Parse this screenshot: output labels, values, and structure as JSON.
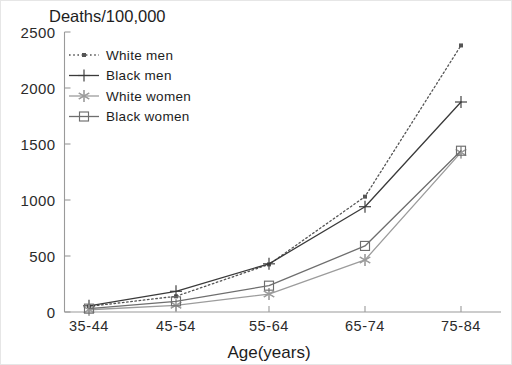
{
  "chart_data": {
    "type": "line",
    "title": "Deaths/100,000",
    "xlabel": "Age(years)",
    "ylabel": "",
    "categories": [
      "35-44",
      "45-54",
      "55-64",
      "65-74",
      "75-84"
    ],
    "ylim": [
      0,
      2500
    ],
    "yticks": [
      0,
      500,
      1000,
      1500,
      2000,
      2500
    ],
    "ytick_labels": [
      "0",
      "500",
      "1000",
      "1500",
      "2000",
      "2500"
    ],
    "grid": false,
    "legend_position": "upper left inside",
    "series": [
      {
        "name": "White men",
        "values": [
          50,
          140,
          425,
          1030,
          2380
        ],
        "line_style": "dotted",
        "marker": "small-filled-square",
        "color": "#555555"
      },
      {
        "name": "Black men",
        "values": [
          55,
          185,
          430,
          940,
          1875
        ],
        "line_style": "solid",
        "marker": "plus",
        "color": "#3a3a3a"
      },
      {
        "name": "White women",
        "values": [
          20,
          60,
          160,
          465,
          1425
        ],
        "line_style": "solid",
        "marker": "asterisk",
        "color": "#9c9c9c"
      },
      {
        "name": "Black women",
        "values": [
          30,
          95,
          235,
          590,
          1440
        ],
        "line_style": "solid",
        "marker": "open-square",
        "color": "#6e6e6e"
      }
    ]
  },
  "legend": {
    "items": [
      {
        "label": "White men"
      },
      {
        "label": "Black men"
      },
      {
        "label": "White women"
      },
      {
        "label": "Black women"
      }
    ]
  },
  "axes": {
    "y_labels": [
      "2500",
      "2000",
      "1500",
      "1000",
      "500",
      "0"
    ],
    "x_labels": [
      "35-44",
      "45-54",
      "55-64",
      "65-74",
      "75-84"
    ]
  },
  "labels": {
    "title": "Deaths/100,000",
    "xaxis_title": "Age(years)"
  }
}
